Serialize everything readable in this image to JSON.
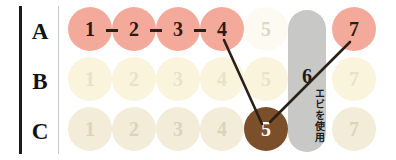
{
  "diagram": {
    "rows": [
      {
        "id": "A",
        "label": "A"
      },
      {
        "id": "B",
        "label": "B"
      },
      {
        "id": "C",
        "label": "C"
      }
    ],
    "columns": [
      "1",
      "2",
      "3",
      "4",
      "5",
      "6",
      "7"
    ],
    "colors": {
      "active_pink_fill": "#f4aa9b",
      "active_pink_text": "#2a1c14",
      "inactive_cream_fill": "#faf4dd",
      "inactive_cream_text": "#e3dcc0",
      "inactive_beige_fill": "#f3ecd9",
      "inactive_beige_text": "#ddd3b8",
      "faint_fill": "#fdfaf1",
      "faint_text": "#ded8c7",
      "selected_brown_fill": "#7a4f2a",
      "selected_brown_text": "#ffffff",
      "pill_gray": "#c8c8c6",
      "connector": "#2a2018",
      "axis_rule": "#1b1b1b",
      "divider_rule": "#c9c9c9"
    },
    "cells": [
      {
        "row": "A",
        "col": "1",
        "label": "1",
        "state": "active"
      },
      {
        "row": "A",
        "col": "2",
        "label": "2",
        "state": "active"
      },
      {
        "row": "A",
        "col": "3",
        "label": "3",
        "state": "active"
      },
      {
        "row": "A",
        "col": "4",
        "label": "4",
        "state": "active"
      },
      {
        "row": "A",
        "col": "5",
        "label": "5",
        "state": "faint"
      },
      {
        "row": "A",
        "col": "7",
        "label": "7",
        "state": "active"
      },
      {
        "row": "B",
        "col": "1",
        "label": "1",
        "state": "inactive-cream"
      },
      {
        "row": "B",
        "col": "2",
        "label": "2",
        "state": "inactive-cream"
      },
      {
        "row": "B",
        "col": "3",
        "label": "3",
        "state": "inactive-cream"
      },
      {
        "row": "B",
        "col": "4",
        "label": "4",
        "state": "inactive-cream"
      },
      {
        "row": "B",
        "col": "5",
        "label": "5",
        "state": "inactive-cream"
      },
      {
        "row": "B",
        "col": "7",
        "label": "7",
        "state": "inactive-cream"
      },
      {
        "row": "C",
        "col": "1",
        "label": "1",
        "state": "inactive-beige"
      },
      {
        "row": "C",
        "col": "2",
        "label": "2",
        "state": "inactive-beige"
      },
      {
        "row": "C",
        "col": "3",
        "label": "3",
        "state": "inactive-beige"
      },
      {
        "row": "C",
        "col": "4",
        "label": "4",
        "state": "inactive-beige"
      },
      {
        "row": "C",
        "col": "5",
        "label": "5",
        "state": "selected"
      },
      {
        "row": "C",
        "col": "7",
        "label": "7",
        "state": "inactive-beige"
      }
    ],
    "column_pill": {
      "column": "6",
      "number_label": "6",
      "vertical_note": "エビを使用"
    },
    "connectors": {
      "dashes": [
        {
          "from": "A1",
          "to": "A2"
        },
        {
          "from": "A2",
          "to": "A3"
        },
        {
          "from": "A3",
          "to": "A4"
        }
      ],
      "lines": [
        {
          "from": "A4",
          "to": "C5"
        },
        {
          "from": "A7",
          "to": "C5"
        }
      ]
    }
  }
}
